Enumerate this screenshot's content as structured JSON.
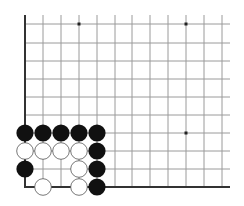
{
  "diagram": {
    "type": "go-board-fragment",
    "grid": {
      "columns_x": [
        25,
        43,
        61,
        79,
        97,
        115,
        132,
        150,
        168,
        186,
        204,
        222
      ],
      "rows_y": [
        24,
        43,
        61,
        79,
        97,
        115,
        133,
        151,
        169,
        187
      ],
      "line_top_y": 15,
      "line_right_x": 230,
      "line_color": "#9a9a9a",
      "edge_color": "#333333"
    },
    "edges": [
      "left",
      "bottom"
    ],
    "star_points": [
      {
        "col": 3,
        "row": 0
      },
      {
        "col": 9,
        "row": 0
      },
      {
        "col": 9,
        "row": 6
      }
    ],
    "stones": [
      {
        "color": "black",
        "col": 0,
        "row": 6
      },
      {
        "color": "black",
        "col": 1,
        "row": 6
      },
      {
        "color": "black",
        "col": 2,
        "row": 6
      },
      {
        "color": "black",
        "col": 3,
        "row": 6
      },
      {
        "color": "black",
        "col": 4,
        "row": 6
      },
      {
        "color": "white",
        "col": 0,
        "row": 7
      },
      {
        "color": "white",
        "col": 1,
        "row": 7
      },
      {
        "color": "white",
        "col": 2,
        "row": 7
      },
      {
        "color": "white",
        "col": 3,
        "row": 7
      },
      {
        "color": "black",
        "col": 4,
        "row": 7
      },
      {
        "color": "black",
        "col": 0,
        "row": 8
      },
      {
        "color": "white",
        "col": 3,
        "row": 8
      },
      {
        "color": "black",
        "col": 4,
        "row": 8
      },
      {
        "color": "white",
        "col": 1,
        "row": 9
      },
      {
        "color": "white",
        "col": 3,
        "row": 9
      },
      {
        "color": "black",
        "col": 4,
        "row": 9
      }
    ],
    "colors": {
      "black_stone": "#111111",
      "white_stone_fill": "#ffffff",
      "white_stone_stroke": "#555555",
      "star_point": "#222222"
    }
  }
}
